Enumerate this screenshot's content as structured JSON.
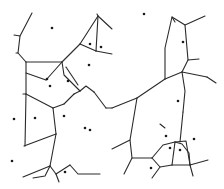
{
  "diagram": {
    "type": "voronoi",
    "width": 224,
    "height": 189,
    "background": "#ffffff",
    "stroke_color": "#2a2a2a",
    "site_color": "#1a1a1a",
    "sites": [
      [
        52,
        28
      ],
      [
        144,
        14
      ],
      [
        183,
        42
      ],
      [
        90,
        44
      ],
      [
        101,
        47
      ],
      [
        89,
        65
      ],
      [
        47,
        79
      ],
      [
        68,
        81
      ],
      [
        50,
        86
      ],
      [
        14,
        119
      ],
      [
        35,
        118
      ],
      [
        64,
        116
      ],
      [
        85,
        128
      ],
      [
        178,
        101
      ],
      [
        166,
        136
      ],
      [
        194,
        139
      ],
      [
        170,
        148
      ],
      [
        180,
        150
      ],
      [
        151,
        168
      ],
      [
        12,
        161
      ],
      [
        65,
        172
      ],
      [
        90,
        130
      ]
    ],
    "edges": [
      "M32,13 L20,36 L14,35",
      "M20,36 L18,53 L16,53",
      "M18,53 L26,62",
      "M26,62 L62,62",
      "M26,62 L26,79 L26,94",
      "M26,73 L46,80",
      "M46,80 L62,62",
      "M62,62 L80,44",
      "M80,44 L98,16 L97,14",
      "M98,16 L112,29",
      "M80,44 L96,51",
      "M96,51 L112,54",
      "M98,16 L96,51",
      "M62,62 L64,75 L80,91",
      "M66,67 L78,85",
      "M80,91 L86,86 L94,92",
      "M26,94 L23,94",
      "M26,94 L53,108",
      "M53,108 L64,104",
      "M64,104 L74,94",
      "M74,94 L80,91",
      "M53,108 L56,134",
      "M56,134 L24,146",
      "M26,94 L25,146",
      "M56,134 L50,166",
      "M50,166 L23,177",
      "M50,166 L45,176 L33,178",
      "M50,166 L56,174 L70,165",
      "M70,165 L78,174 L100,174",
      "M56,174 L59,182",
      "M94,92 L106,108",
      "M106,108 L112,108",
      "M112,108 L137,98",
      "M137,98 L165,79",
      "M137,98 L134,116 L130,140 L112,149",
      "M165,79 L165,48 L172,17 L185,25 L205,16",
      "M172,17 L175,22",
      "M185,25 L188,60 L199,59",
      "M188,60 L182,72",
      "M182,72 L165,79",
      "M182,72 L207,77",
      "M207,77 L216,83",
      "M182,72 L185,91 L183,112",
      "M160,124 L165,128",
      "M130,140 L132,158 L124,174",
      "M132,158 L152,158",
      "M152,158 L163,145 L175,142",
      "M175,142 L182,144 L189,153 L190,165",
      "M175,142 L186,141 L190,165",
      "M190,165 L208,160",
      "M190,165 L193,176",
      "M152,158 L160,167 L152,178",
      "M160,167 L172,165",
      "M172,165 L175,142",
      "M172,165 L190,165",
      "M183,112 L180,142"
    ]
  }
}
